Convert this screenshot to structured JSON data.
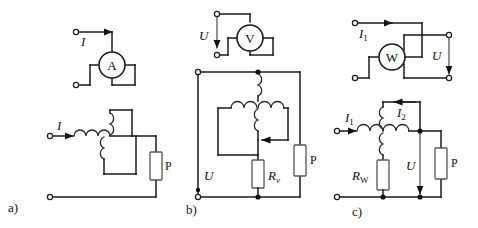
{
  "figure": {
    "background_color": "#ffffff",
    "line_color": "#1a1a1a",
    "resistor_color": "#555555"
  },
  "panels": [
    {
      "id": "a",
      "caption": "a)",
      "description": "Current transformer with ammeter",
      "meter": {
        "symbol": "A",
        "name": "ammeter"
      },
      "labels": {
        "current_top": "I",
        "current_bottom": "I",
        "load": "P"
      }
    },
    {
      "id": "b",
      "caption": "b)",
      "description": "Voltage transformer with voltmeter",
      "meter": {
        "symbol": "V",
        "name": "voltmeter"
      },
      "labels": {
        "voltage_meter": "U",
        "voltage_line": "U",
        "resistor": "R",
        "resistor_sub": "v",
        "load": "P"
      }
    },
    {
      "id": "c",
      "caption": "c)",
      "description": "Wattmeter with current and voltage circuits",
      "meter": {
        "symbol": "W",
        "name": "wattmeter"
      },
      "labels": {
        "current_top": "I",
        "current_top_sub": "1",
        "voltage_top": "U",
        "current_primary": "I",
        "current_primary_sub": "1",
        "current_secondary": "I",
        "current_secondary_sub": "2",
        "voltage_line": "U",
        "resistor": "R",
        "resistor_sub": "W",
        "load": "P"
      }
    }
  ]
}
